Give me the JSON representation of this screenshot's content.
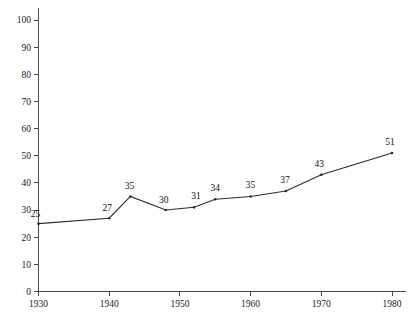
{
  "chart_data": {
    "type": "line",
    "title": "",
    "subtitle": "",
    "xlabel": "",
    "ylabel": "",
    "xlim": [
      1930,
      1980
    ],
    "ylim": [
      0,
      100
    ],
    "grid": false,
    "legend": "none",
    "y_ticks": [
      100,
      90,
      80,
      70,
      60,
      50,
      40,
      30,
      20,
      10,
      0
    ],
    "x_ticks": [
      1930,
      1940,
      1950,
      1960,
      1970,
      1980
    ],
    "x_tick_labels": [
      "1930",
      "1940",
      "1950",
      "1960",
      "1970",
      "1980"
    ],
    "y_tick_labels": [
      "100",
      "90",
      "80",
      "70",
      "60",
      "50",
      "40",
      "30",
      "20",
      "10",
      "0"
    ],
    "series": [
      {
        "name": "series-1",
        "color": "#2b2b2b",
        "x": [
          1930,
          1940,
          1943,
          1948,
          1952,
          1955,
          1960,
          1965,
          1970,
          1980
        ],
        "values": [
          25,
          27,
          35,
          30,
          31,
          34,
          35,
          37,
          43,
          51
        ],
        "point_labels": [
          "25",
          "27",
          "35",
          "30",
          "31",
          "34",
          "35",
          "37",
          "43",
          "51"
        ]
      }
    ]
  },
  "axes": {
    "x_axis_name": "year-axis",
    "y_axis_name": "value-axis"
  }
}
